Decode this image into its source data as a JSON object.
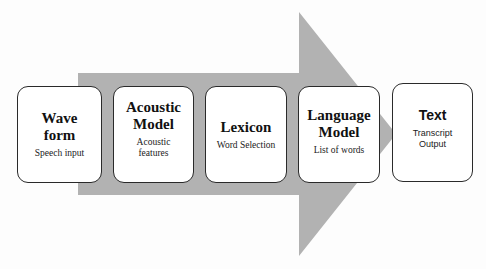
{
  "diagram": {
    "type": "process-flow",
    "arrow_color": "#b2b2b2",
    "box_border_color": "#2a2a2a",
    "steps": [
      {
        "title": "Wave form",
        "title_lines": [
          "Wave",
          "form"
        ],
        "subtitle_lines": [
          "Speech input"
        ]
      },
      {
        "title": "Acoustic Model",
        "title_lines": [
          "Acoustic",
          "Model"
        ],
        "subtitle_lines": [
          "Acoustic",
          "features"
        ]
      },
      {
        "title": "Lexicon",
        "title_lines": [
          "Lexicon"
        ],
        "subtitle_lines": [
          "Word Selection"
        ]
      },
      {
        "title": "Language Model",
        "title_lines": [
          "Language",
          "Model"
        ],
        "subtitle_lines": [
          "List of words"
        ]
      },
      {
        "title": "Text",
        "title_lines": [
          "Text"
        ],
        "subtitle_lines": [
          "Transcript",
          "Output"
        ]
      }
    ]
  }
}
